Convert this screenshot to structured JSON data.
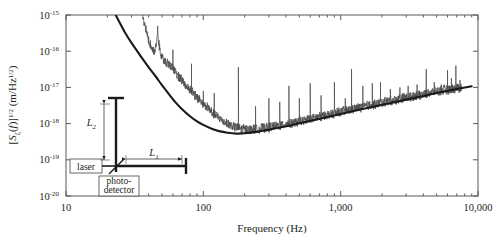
{
  "chart_data": {
    "type": "line",
    "title": "",
    "xlabel": "Frequency (Hz)",
    "ylabel": "[Sξ(f)]1/2 (m/Hz1/2)",
    "xscale": "log",
    "yscale": "log",
    "xlim": [
      10,
      10000
    ],
    "ylim": [
      1e-20,
      1e-15
    ],
    "grid": false,
    "legend_position": "none",
    "xticks": [
      {
        "value": 10,
        "label": "10"
      },
      {
        "value": 100,
        "label": "100"
      },
      {
        "value": 1000,
        "label": "1,000"
      },
      {
        "value": 10000,
        "label": "10,000"
      }
    ],
    "yticks": [
      {
        "value": 1e-15,
        "mantissa": "10",
        "exponent": "-15"
      },
      {
        "value": 1e-16,
        "mantissa": "10",
        "exponent": "-16"
      },
      {
        "value": 1e-17,
        "mantissa": "10",
        "exponent": "-17"
      },
      {
        "value": 1e-18,
        "mantissa": "10",
        "exponent": "-18"
      },
      {
        "value": 1e-19,
        "mantissa": "10",
        "exponent": "-19"
      },
      {
        "value": 1e-20,
        "mantissa": "10",
        "exponent": "-20"
      }
    ],
    "series": [
      {
        "name": "theoretical-noise-model",
        "style": "thick-smooth",
        "color": "#1a1a1a",
        "points": [
          [
            23.0,
            1e-15
          ],
          [
            25.0,
            5.5e-16
          ],
          [
            27.0,
            3.2e-16
          ],
          [
            30.0,
            1.7e-16
          ],
          [
            33.0,
            1e-16
          ],
          [
            36.0,
            6.2e-17
          ],
          [
            40.0,
            3.6e-17
          ],
          [
            45.0,
            2e-17
          ],
          [
            50.0,
            1.15e-17
          ],
          [
            56.0,
            6.6e-18
          ],
          [
            63.0,
            3.8e-18
          ],
          [
            70.0,
            2.5e-18
          ],
          [
            80.0,
            1.6e-18
          ],
          [
            90.0,
            1.15e-18
          ],
          [
            100.0,
            9.2e-19
          ],
          [
            115.0,
            7.2e-19
          ],
          [
            130.0,
            6.2e-19
          ],
          [
            150.0,
            5.6e-19
          ],
          [
            175.0,
            5.3e-19
          ],
          [
            200.0,
            5.4e-19
          ],
          [
            250.0,
            6e-19
          ],
          [
            300.0,
            6.8e-19
          ],
          [
            400.0,
            8.4e-19
          ],
          [
            500.0,
            1.02e-18
          ],
          [
            700.0,
            1.35e-18
          ],
          [
            1000.0,
            1.85e-18
          ],
          [
            1500.0,
            2.6e-18
          ],
          [
            2000.0,
            3.3e-18
          ],
          [
            3000.0,
            4.6e-18
          ],
          [
            4000.0,
            5.8e-18
          ],
          [
            5000.0,
            7e-18
          ],
          [
            7000.0,
            9e-18
          ],
          [
            9000.0,
            1.08e-17
          ]
        ]
      },
      {
        "name": "measured-displacement-noise",
        "style": "thin-noisy-with-spikes",
        "color": "#4d4d4d",
        "points": [
          [
            36.0,
            1e-15
          ],
          [
            38.0,
            4e-16
          ],
          [
            40.0,
            1.9e-16
          ],
          [
            42.0,
            1.25e-16
          ],
          [
            44.0,
            1e-16
          ],
          [
            45.5,
            1.6e-16
          ],
          [
            46.5,
            4.2e-16
          ],
          [
            47.5,
            1.6e-16
          ],
          [
            49.0,
            8.5e-17
          ],
          [
            51.0,
            6.2e-17
          ],
          [
            54.0,
            5e-17
          ],
          [
            57.0,
            4.2e-17
          ],
          [
            60.0,
            3.4e-17
          ],
          [
            63.0,
            2.6e-17
          ],
          [
            66.0,
            2e-17
          ],
          [
            70.0,
            1.5e-17
          ],
          [
            74.0,
            1.15e-17
          ],
          [
            78.0,
            9.5e-18
          ],
          [
            82.0,
            8e-18
          ],
          [
            86.0,
            6.5e-18
          ],
          [
            90.0,
            5.2e-18
          ],
          [
            95.0,
            4.3e-18
          ],
          [
            100.0,
            3.4e-18
          ],
          [
            106.0,
            2.8e-18
          ],
          [
            112.0,
            2.3e-18
          ],
          [
            118.0,
            1.9e-18
          ],
          [
            125.0,
            1.6e-18
          ],
          [
            132.0,
            1.35e-18
          ],
          [
            140.0,
            1.15e-18
          ],
          [
            150.0,
            1e-18
          ],
          [
            160.0,
            8.8e-19
          ],
          [
            175.0,
            7.8e-19
          ],
          [
            190.0,
            7.2e-19
          ],
          [
            210.0,
            6.9e-19
          ],
          [
            230.0,
            7e-19
          ],
          [
            260.0,
            7.4e-19
          ],
          [
            300.0,
            8e-19
          ],
          [
            350.0,
            8.8e-19
          ],
          [
            400.0,
            9.6e-19
          ],
          [
            500.0,
            1.15e-18
          ],
          [
            600.0,
            1.35e-18
          ],
          [
            700.0,
            1.55e-18
          ],
          [
            850.0,
            1.85e-18
          ],
          [
            1000.0,
            2.1e-18
          ],
          [
            1200.0,
            2.5e-18
          ],
          [
            1500.0,
            3e-18
          ],
          [
            2000.0,
            3.8e-18
          ],
          [
            2500.0,
            4.6e-18
          ],
          [
            3000.0,
            5.3e-18
          ],
          [
            4000.0,
            6.6e-18
          ],
          [
            5000.0,
            7.8e-18
          ],
          [
            6000.0,
            8.8e-18
          ],
          [
            7000.0,
            9.6e-18
          ],
          [
            7600.0,
            1e-17
          ]
        ],
        "spikes": [
          {
            "freq": 46.5,
            "peak": 5e-16
          },
          {
            "freq": 60.0,
            "peak": 1.1e-16
          },
          {
            "freq": 82.0,
            "peak": 4.5e-17
          },
          {
            "freq": 100.0,
            "peak": 8e-18
          },
          {
            "freq": 120.0,
            "peak": 7e-18
          },
          {
            "freq": 180.0,
            "peak": 3.6e-17
          },
          {
            "freq": 240.0,
            "peak": 3e-18
          },
          {
            "freq": 300.0,
            "peak": 5e-18
          },
          {
            "freq": 360.0,
            "peak": 4e-18
          },
          {
            "freq": 420.0,
            "peak": 1.1e-17
          },
          {
            "freq": 500.0,
            "peak": 5e-18
          },
          {
            "freq": 600.0,
            "peak": 1.3e-17
          },
          {
            "freq": 720.0,
            "peak": 6e-18
          },
          {
            "freq": 900.0,
            "peak": 1.4e-17
          },
          {
            "freq": 1080.0,
            "peak": 5e-18
          },
          {
            "freq": 1200.0,
            "peak": 3.2e-17
          },
          {
            "freq": 1450.0,
            "peak": 1.1e-17
          },
          {
            "freq": 1700.0,
            "peak": 1.3e-17
          },
          {
            "freq": 1950.0,
            "peak": 1.4e-17
          },
          {
            "freq": 2300.0,
            "peak": 9e-18
          },
          {
            "freq": 2700.0,
            "peak": 1e-17
          },
          {
            "freq": 3100.0,
            "peak": 1.1e-17
          },
          {
            "freq": 3600.0,
            "peak": 1.2e-17
          },
          {
            "freq": 4200.0,
            "peak": 3.2e-17
          },
          {
            "freq": 4800.0,
            "peak": 1.4e-17
          },
          {
            "freq": 5400.0,
            "peak": 1.2e-17
          },
          {
            "freq": 6000.0,
            "peak": 3e-17
          },
          {
            "freq": 6400.0,
            "peak": 1.8e-17
          },
          {
            "freq": 6900.0,
            "peak": 4e-17
          },
          {
            "freq": 7400.0,
            "peak": 1.6e-17
          }
        ]
      }
    ]
  },
  "inset": {
    "name": "michelson-interferometer-schematic",
    "laser_label": "laser",
    "detector_label_line1": "photo-",
    "detector_label_line2": "detector",
    "arm1_label": "L",
    "arm1_sub": "1",
    "arm2_label": "L",
    "arm2_sub": "2"
  },
  "colors": {
    "theory_curve": "#1a1a1a",
    "measured_curve": "#4d4d4d",
    "axis": "#58595b",
    "text": "#231f20",
    "background": "#ffffff"
  }
}
